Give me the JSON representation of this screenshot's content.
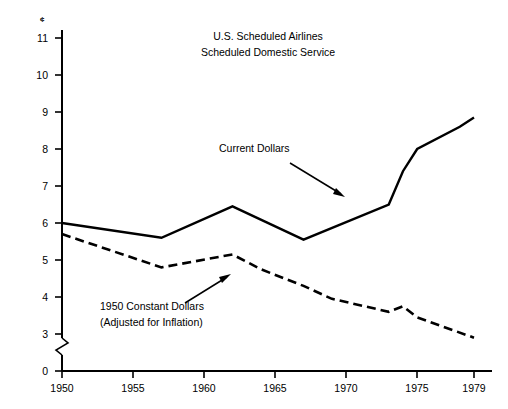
{
  "chart_data": {
    "type": "line",
    "title_line1": "U.S. Scheduled Airlines",
    "title_line2": "Scheduled Domestic Service",
    "xlabel": "",
    "ylabel": "",
    "y_unit_symbol": "¢",
    "xlim": [
      1950,
      1980.5
    ],
    "ylim": [
      0,
      11.4
    ],
    "y_axis_break": true,
    "y_axis_break_between": [
      0,
      3
    ],
    "grid": false,
    "legend": "annotations",
    "xticks": [
      1950,
      1955,
      1960,
      1965,
      1970,
      1975,
      1979
    ],
    "xtick_labels": [
      "1950",
      "1955",
      "1960",
      "1965",
      "1970",
      "1975",
      "1979"
    ],
    "yticks": [
      0,
      3,
      4,
      5,
      6,
      7,
      8,
      9,
      10,
      11
    ],
    "ytick_labels": [
      "0",
      "3",
      "4",
      "5",
      "6",
      "7",
      "8",
      "9",
      "10",
      "11"
    ],
    "series": [
      {
        "name": "Current Dollars",
        "style": "solid",
        "x": [
          1950,
          1957,
          1962,
          1967,
          1973,
          1974,
          1975,
          1978,
          1979
        ],
        "values": [
          6.0,
          5.6,
          6.45,
          5.55,
          6.5,
          7.4,
          8.0,
          8.6,
          8.85
        ]
      },
      {
        "name": "1950 Constant Dollars",
        "style": "dashed",
        "x": [
          1950,
          1957,
          1962,
          1964,
          1967,
          1969,
          1973,
          1974,
          1975,
          1979
        ],
        "values": [
          5.7,
          4.8,
          5.15,
          4.75,
          4.3,
          3.95,
          3.6,
          3.75,
          3.45,
          2.9
        ]
      }
    ],
    "annotations": [
      {
        "id": "current-dollars",
        "label": "Current Dollars",
        "text_x": 219,
        "text_y": 152,
        "arrow_from": [
          290,
          163
        ],
        "arrow_to": [
          345,
          197
        ]
      },
      {
        "id": "constant-dollars",
        "label_line1": "1950 Constant Dollars",
        "label_line2": "(Adjusted for Inflation)",
        "text_x": 100,
        "text_y": 310,
        "arrow_from": [
          185,
          303
        ],
        "arrow_to": [
          231,
          274
        ]
      }
    ],
    "colors": {
      "line": "#000000",
      "text": "#000000",
      "background": "#ffffff"
    }
  }
}
